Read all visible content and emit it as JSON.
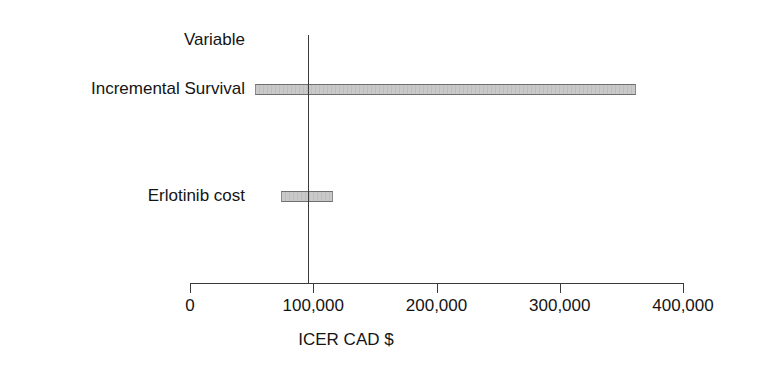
{
  "chart_data": {
    "type": "bar",
    "subtype": "tornado",
    "orientation": "horizontal",
    "title": "",
    "xlabel": "ICER CAD $",
    "ylabel": "",
    "column_header": "Variable",
    "categories": [
      "Incremental Survival",
      "Erlotinib cost"
    ],
    "xlim": [
      0,
      400000
    ],
    "xticks": [
      0,
      100000,
      200000,
      300000,
      400000
    ],
    "xtick_labels": [
      "0",
      "100,000",
      "200,000",
      "300,000",
      "400,000"
    ],
    "grid": false,
    "legend": false,
    "baseline_value": 96000,
    "baseline_line": true,
    "bars": [
      {
        "label": "Incremental Survival",
        "low": 52800,
        "high": 361800,
        "range": 309000
      },
      {
        "label": "Erlotinib cost",
        "low": 74000,
        "high": 116300,
        "range": 42300
      }
    ],
    "colors": {
      "bar_fill": "#c9c9c9",
      "bar_edge": "#6e6e6e",
      "axis": "#3a3a3a",
      "text": "#141414",
      "background": "#ffffff"
    }
  }
}
